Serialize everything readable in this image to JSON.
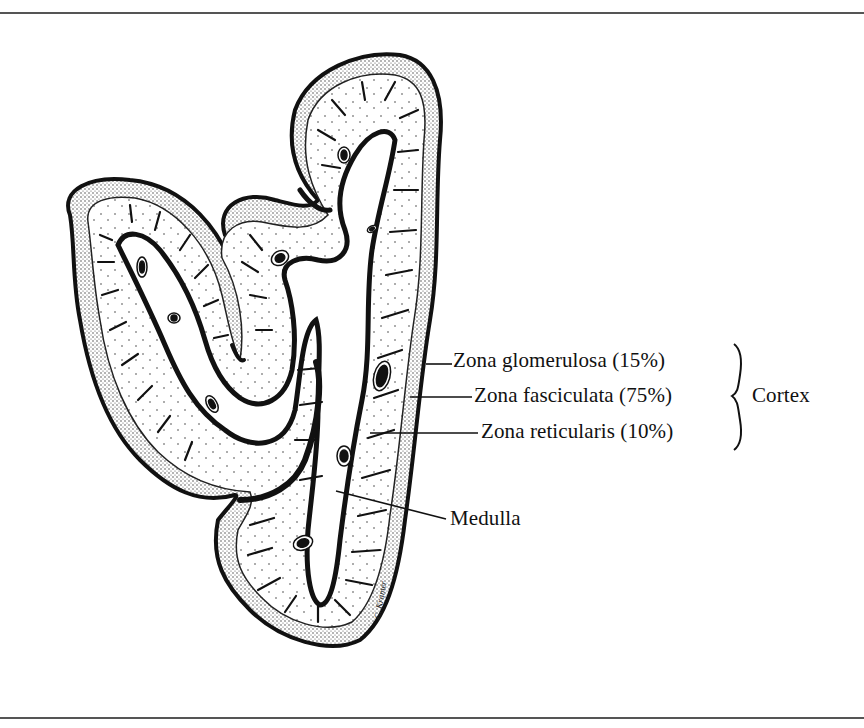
{
  "figure": {
    "labels": {
      "zona_glomerulosa": "Zona glomerulosa (15%)",
      "zona_fasciculata": "Zona fasciculata (75%)",
      "zona_reticularis": "Zona reticularis (10%)",
      "medulla": "Medulla",
      "cortex": "Cortex"
    },
    "bracket_groups": {
      "cortex": [
        "Zona glomerulosa (15%)",
        "Zona fasciculata (75%)",
        "Zona reticularis (10%)"
      ]
    },
    "signature": "C. Kramer"
  },
  "colors": {
    "ink": "#111111",
    "paper": "#ffffff",
    "frame": "#555555"
  }
}
